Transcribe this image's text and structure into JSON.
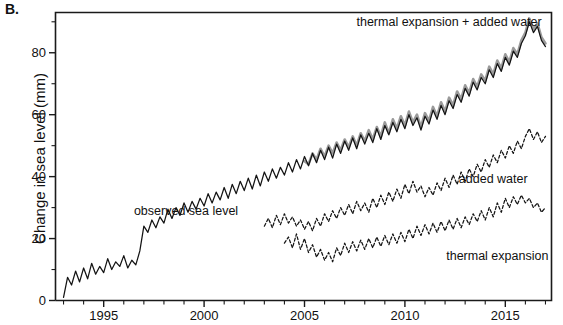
{
  "panel": {
    "label": "B."
  },
  "chart_data": {
    "type": "line",
    "title": "",
    "subtitle": "",
    "xlabel": "",
    "ylabel": "Change in sea level (mm)",
    "xlim": [
      1992.6,
      2017.3
    ],
    "ylim": [
      0,
      93
    ],
    "grid": false,
    "legend_position": "inline-annotations",
    "x_ticks_major": [
      1995,
      2000,
      2005,
      2010,
      2015
    ],
    "x_tick_labels": [
      "1995",
      "2000",
      "2005",
      "2010",
      "2015"
    ],
    "x_ticks_minor": [
      1993,
      1994,
      1996,
      1997,
      1998,
      1999,
      2001,
      2002,
      2003,
      2004,
      2006,
      2007,
      2008,
      2009,
      2011,
      2012,
      2013,
      2014,
      2016,
      2017
    ],
    "y_ticks_major": [
      0,
      20,
      40,
      60,
      80
    ],
    "y_tick_labels": [
      "0",
      "20",
      "40",
      "60",
      "80"
    ],
    "y_ticks_minor": [
      10,
      30,
      50,
      70,
      90
    ],
    "annotations": [
      {
        "name": "observed-sea-level",
        "text": "observed sea level",
        "x": 1999.1,
        "y": 27.5
      },
      {
        "name": "thermal-expansion-plus-added-water",
        "text": "thermal expansion + added water",
        "x": 2012.2,
        "y": 88.5
      },
      {
        "name": "added-water",
        "text": "added water",
        "x": 2014.4,
        "y": 38.0
      },
      {
        "name": "thermal-expansion",
        "text": "thermal expansion",
        "x": 2014.6,
        "y": 13.0
      }
    ],
    "series": [
      {
        "name": "observed sea level",
        "style": "solid",
        "color": "#141414",
        "x": [
          1993.0,
          1993.2,
          1993.4,
          1993.6,
          1993.8,
          1994.0,
          1994.2,
          1994.4,
          1994.6,
          1994.8,
          1995.0,
          1995.2,
          1995.4,
          1995.6,
          1995.8,
          1996.0,
          1996.2,
          1996.4,
          1996.6,
          1996.8,
          1997.0,
          1997.2,
          1997.4,
          1997.6,
          1997.8,
          1998.0,
          1998.2,
          1998.4,
          1998.6,
          1998.8,
          1999.0,
          1999.2,
          1999.4,
          1999.6,
          1999.8,
          2000.0,
          2000.2,
          2000.4,
          2000.6,
          2000.8,
          2001.0,
          2001.2,
          2001.4,
          2001.6,
          2001.8,
          2002.0,
          2002.2,
          2002.4,
          2002.6,
          2002.8,
          2003.0,
          2003.2,
          2003.4,
          2003.6,
          2003.8,
          2004.0,
          2004.2,
          2004.4,
          2004.6,
          2004.8,
          2005.0,
          2005.2,
          2005.4,
          2005.6,
          2005.8,
          2006.0,
          2006.2,
          2006.4,
          2006.6,
          2006.8,
          2007.0,
          2007.2,
          2007.4,
          2007.6,
          2007.8,
          2008.0,
          2008.2,
          2008.4,
          2008.6,
          2008.8,
          2009.0,
          2009.2,
          2009.4,
          2009.6,
          2009.8,
          2010.0,
          2010.2,
          2010.4,
          2010.6,
          2010.8,
          2011.0,
          2011.2,
          2011.4,
          2011.6,
          2011.8,
          2012.0,
          2012.2,
          2012.4,
          2012.6,
          2012.8,
          2013.0,
          2013.2,
          2013.4,
          2013.6,
          2013.8,
          2014.0,
          2014.2,
          2014.4,
          2014.6,
          2014.8,
          2015.0,
          2015.2,
          2015.4,
          2015.6,
          2015.8,
          2016.0,
          2016.2,
          2016.4,
          2016.6,
          2016.8,
          2017.0
        ],
        "values": [
          1.0,
          7.5,
          5.0,
          9.5,
          6.0,
          10.5,
          7.0,
          12.0,
          8.5,
          11.0,
          9.0,
          13.5,
          10.0,
          12.5,
          11.0,
          14.5,
          10.5,
          13.0,
          11.5,
          16.0,
          24.0,
          22.0,
          26.0,
          23.5,
          27.0,
          25.0,
          29.5,
          26.5,
          30.0,
          27.5,
          31.5,
          28.5,
          32.0,
          29.5,
          33.0,
          30.5,
          34.5,
          31.5,
          35.0,
          32.5,
          36.5,
          33.0,
          37.5,
          34.5,
          38.5,
          35.5,
          39.5,
          36.0,
          40.5,
          37.0,
          41.5,
          38.5,
          42.5,
          39.5,
          43.0,
          40.5,
          44.5,
          41.5,
          45.5,
          42.5,
          46.5,
          43.5,
          47.5,
          44.5,
          48.5,
          45.5,
          49.5,
          46.0,
          50.5,
          47.5,
          51.5,
          48.5,
          52.5,
          49.0,
          53.5,
          50.5,
          54.0,
          51.0,
          55.5,
          52.0,
          56.5,
          53.5,
          57.5,
          54.5,
          58.5,
          55.5,
          60.0,
          56.5,
          59.0,
          55.0,
          59.5,
          57.0,
          61.5,
          58.5,
          63.0,
          60.0,
          64.5,
          62.0,
          66.5,
          64.0,
          68.5,
          66.0,
          70.5,
          68.0,
          72.0,
          70.0,
          74.5,
          72.0,
          76.5,
          74.0,
          78.5,
          76.0,
          80.5,
          78.5,
          83.0,
          85.5,
          90.0,
          86.5,
          88.5,
          84.0,
          82.0
        ]
      },
      {
        "name": "thermal expansion + added water",
        "style": "thick-gray",
        "color": "#9a9a9a",
        "x": [
          2005.0,
          2005.2,
          2005.4,
          2005.6,
          2005.8,
          2006.0,
          2006.2,
          2006.4,
          2006.6,
          2006.8,
          2007.0,
          2007.2,
          2007.4,
          2007.6,
          2007.8,
          2008.0,
          2008.2,
          2008.4,
          2008.6,
          2008.8,
          2009.0,
          2009.2,
          2009.4,
          2009.6,
          2009.8,
          2010.0,
          2010.2,
          2010.4,
          2010.6,
          2010.8,
          2011.0,
          2011.2,
          2011.4,
          2011.6,
          2011.8,
          2012.0,
          2012.2,
          2012.4,
          2012.6,
          2012.8,
          2013.0,
          2013.2,
          2013.4,
          2013.6,
          2013.8,
          2014.0,
          2014.2,
          2014.4,
          2014.6,
          2014.8,
          2015.0,
          2015.2,
          2015.4,
          2015.6,
          2015.8,
          2016.0,
          2016.2,
          2016.4,
          2016.6,
          2016.8,
          2017.0
        ],
        "values": [
          45.0,
          44.0,
          47.5,
          45.5,
          49.0,
          46.5,
          50.0,
          47.5,
          51.0,
          48.5,
          52.0,
          49.5,
          53.0,
          50.0,
          54.0,
          51.5,
          55.0,
          52.0,
          56.0,
          53.0,
          57.5,
          54.0,
          58.5,
          55.5,
          59.5,
          56.5,
          61.0,
          57.5,
          60.0,
          56.0,
          60.5,
          58.0,
          62.5,
          59.5,
          64.0,
          61.0,
          65.5,
          63.0,
          67.5,
          65.0,
          69.5,
          67.0,
          71.5,
          69.0,
          73.0,
          71.0,
          75.5,
          73.0,
          77.5,
          75.0,
          79.5,
          77.0,
          81.5,
          79.5,
          84.0,
          86.5,
          91.0,
          87.5,
          89.5,
          85.0,
          83.0
        ]
      },
      {
        "name": "added water",
        "style": "dashed",
        "color": "#141414",
        "x": [
          2003.0,
          2003.2,
          2003.4,
          2003.6,
          2003.8,
          2004.0,
          2004.2,
          2004.4,
          2004.6,
          2004.8,
          2005.0,
          2005.2,
          2005.4,
          2005.6,
          2005.8,
          2006.0,
          2006.2,
          2006.4,
          2006.6,
          2006.8,
          2007.0,
          2007.2,
          2007.4,
          2007.6,
          2007.8,
          2008.0,
          2008.2,
          2008.4,
          2008.6,
          2008.8,
          2009.0,
          2009.2,
          2009.4,
          2009.6,
          2009.8,
          2010.0,
          2010.2,
          2010.4,
          2010.6,
          2010.8,
          2011.0,
          2011.2,
          2011.4,
          2011.6,
          2011.8,
          2012.0,
          2012.2,
          2012.4,
          2012.6,
          2012.8,
          2013.0,
          2013.2,
          2013.4,
          2013.6,
          2013.8,
          2014.0,
          2014.2,
          2014.4,
          2014.6,
          2014.8,
          2015.0,
          2015.2,
          2015.4,
          2015.6,
          2015.8,
          2016.0,
          2016.2,
          2016.4,
          2016.6,
          2016.8,
          2017.0
        ],
        "values": [
          24.0,
          26.5,
          23.5,
          27.5,
          24.5,
          28.0,
          25.0,
          27.0,
          24.0,
          26.0,
          23.0,
          25.5,
          22.5,
          26.5,
          24.0,
          28.0,
          25.5,
          29.0,
          26.5,
          30.0,
          27.5,
          31.0,
          28.0,
          32.0,
          29.0,
          31.5,
          28.5,
          33.0,
          30.0,
          34.0,
          31.0,
          35.0,
          32.0,
          36.0,
          33.0,
          37.5,
          34.5,
          38.5,
          35.0,
          37.0,
          33.5,
          36.5,
          34.0,
          38.0,
          35.5,
          39.5,
          36.5,
          40.5,
          37.5,
          41.5,
          38.5,
          42.5,
          40.0,
          44.0,
          41.5,
          45.5,
          43.0,
          47.0,
          44.5,
          48.5,
          46.0,
          50.0,
          47.5,
          51.5,
          49.0,
          53.0,
          55.5,
          52.0,
          54.5,
          51.0,
          53.0
        ]
      },
      {
        "name": "thermal expansion",
        "style": "dashed",
        "color": "#141414",
        "x": [
          2004.0,
          2004.2,
          2004.4,
          2004.6,
          2004.8,
          2005.0,
          2005.2,
          2005.4,
          2005.6,
          2005.8,
          2006.0,
          2006.2,
          2006.4,
          2006.6,
          2006.8,
          2007.0,
          2007.2,
          2007.4,
          2007.6,
          2007.8,
          2008.0,
          2008.2,
          2008.4,
          2008.6,
          2008.8,
          2009.0,
          2009.2,
          2009.4,
          2009.6,
          2009.8,
          2010.0,
          2010.2,
          2010.4,
          2010.6,
          2010.8,
          2011.0,
          2011.2,
          2011.4,
          2011.6,
          2011.8,
          2012.0,
          2012.2,
          2012.4,
          2012.6,
          2012.8,
          2013.0,
          2013.2,
          2013.4,
          2013.6,
          2013.8,
          2014.0,
          2014.2,
          2014.4,
          2014.6,
          2014.8,
          2015.0,
          2015.2,
          2015.4,
          2015.6,
          2015.8,
          2016.0,
          2016.2,
          2016.4,
          2016.6,
          2016.8,
          2017.0
        ],
        "values": [
          18.5,
          20.5,
          17.0,
          21.5,
          16.5,
          20.0,
          15.5,
          18.0,
          14.0,
          16.5,
          13.0,
          15.5,
          12.5,
          17.0,
          14.5,
          18.5,
          15.5,
          19.0,
          16.0,
          19.5,
          16.5,
          20.0,
          17.0,
          20.5,
          17.5,
          21.0,
          18.0,
          21.5,
          18.5,
          22.0,
          19.0,
          23.0,
          20.0,
          24.0,
          21.0,
          24.5,
          21.5,
          25.0,
          22.0,
          25.5,
          22.5,
          26.0,
          23.0,
          26.5,
          23.5,
          27.0,
          24.5,
          28.0,
          25.5,
          29.0,
          26.0,
          30.0,
          27.0,
          31.5,
          28.5,
          33.0,
          30.0,
          33.5,
          31.0,
          34.0,
          31.5,
          33.0,
          30.0,
          31.5,
          28.5,
          30.0
        ]
      }
    ]
  }
}
